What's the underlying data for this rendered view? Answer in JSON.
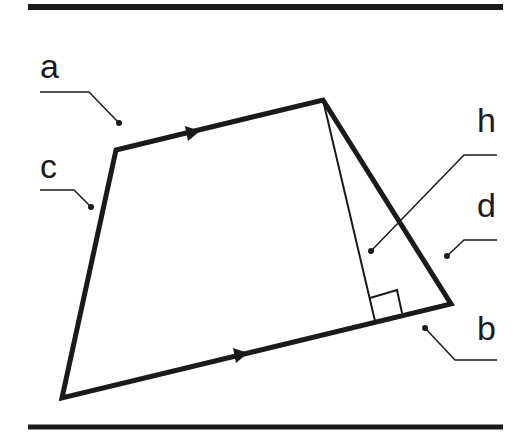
{
  "diagram": {
    "type": "trapezoid",
    "labels": {
      "a": "a",
      "b": "b",
      "c": "c",
      "d": "d",
      "h": "h"
    },
    "vertices": {
      "top_left": [
        116,
        150
      ],
      "top_right": [
        323,
        100
      ],
      "bottom_right": [
        451,
        304
      ],
      "bottom_left": [
        62,
        398
      ]
    },
    "height_foot": [
      375,
      321
    ],
    "parallel_sides": [
      "a",
      "b"
    ],
    "colors": {
      "stroke": "#1a1a1a",
      "background": "#ffffff"
    }
  }
}
